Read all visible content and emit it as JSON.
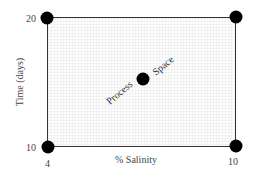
{
  "diagram": {
    "region_label_left": "Process",
    "region_label_right": "Space",
    "x_axis": {
      "label": "% Salinity",
      "min_label": "4",
      "max_label": "10"
    },
    "y_axis": {
      "label": "Time (days)",
      "min_label": "10",
      "max_label": "20"
    },
    "points": [
      {
        "name": "low-salinity-long-time",
        "salinity": 4,
        "days": 20
      },
      {
        "name": "high-salinity-long-time",
        "salinity": 10,
        "days": 20
      },
      {
        "name": "low-salinity-short-time",
        "salinity": 4,
        "days": 10
      },
      {
        "name": "high-salinity-short-time",
        "salinity": 10,
        "days": 10
      },
      {
        "name": "center-point",
        "salinity": 7,
        "days": 15
      }
    ],
    "colors": {
      "border": "#333333",
      "points": "#000000",
      "text": "#444444"
    }
  }
}
